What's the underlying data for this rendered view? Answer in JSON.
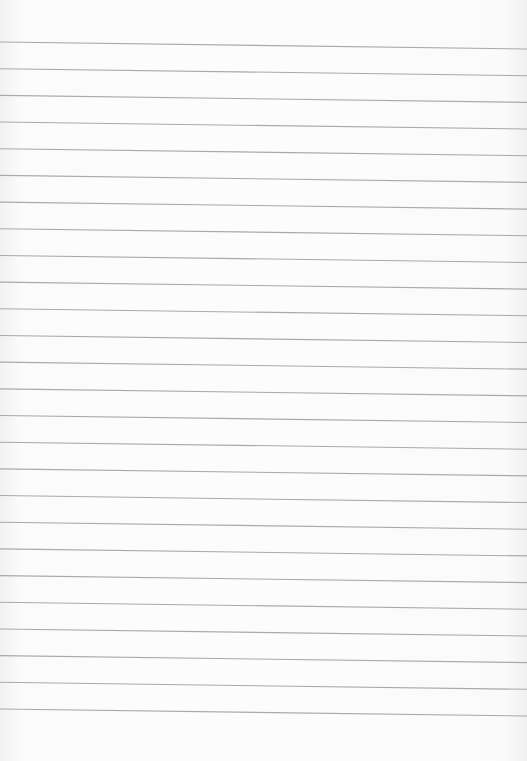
{
  "paper": {
    "type": "lined-sheet",
    "line_count": 26,
    "first_line_left_y": 42,
    "first_line_right_y": 49,
    "line_spacing": 26.68,
    "colors": {
      "paper": "#fafafa",
      "rule": "#a9a9a9"
    }
  }
}
